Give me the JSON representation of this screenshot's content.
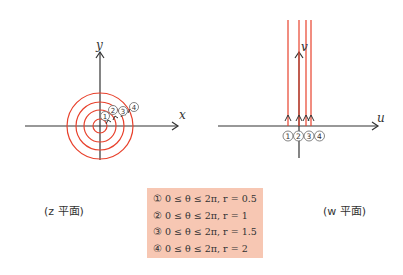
{
  "z_plane": {
    "axis_x_label": "x",
    "axis_y_label": "y",
    "caption": "(z 平面)",
    "circle_color": "#e8412c",
    "markers": [
      "①",
      "②",
      "③",
      "④"
    ],
    "circles": [
      {
        "id": 1,
        "r": 0.5
      },
      {
        "id": 2,
        "r": 1
      },
      {
        "id": 3,
        "r": 1.5
      },
      {
        "id": 4,
        "r": 2
      }
    ]
  },
  "w_plane": {
    "axis_u_label": "u",
    "axis_v_label": "v",
    "caption": "(w 平面)",
    "line_color": "#e8412c",
    "markers": "①②③④"
  },
  "legend": {
    "background": "#f7c7b3",
    "rows": [
      "① 0 ≤ θ ≤ 2π, r = 0.5",
      "② 0 ≤ θ ≤ 2π, r = 1",
      "③ 0 ≤ θ ≤ 2π, r = 1.5",
      "④ 0 ≤ θ ≤ 2π, r = 2"
    ]
  }
}
